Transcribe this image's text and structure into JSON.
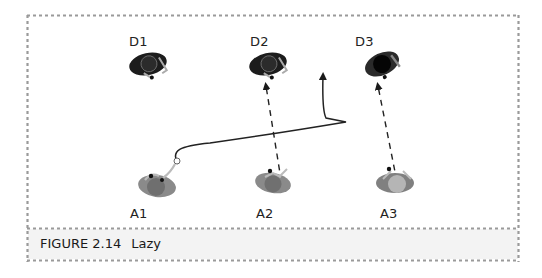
{
  "figure": {
    "caption_label": "FIGURE 2.14",
    "caption_title": "Lazy",
    "colors": {
      "border_dots": "#9a9a9a",
      "caption_fill": "#f3f3f3",
      "defender_body": "#1c1c1c",
      "attacker_body": "#8a8a8a",
      "attacker_head_a1": "#6f6f6f",
      "attacker_head_a2": "#707070",
      "attacker_head_a3": "#b5b5b5",
      "path_line": "#222222"
    }
  },
  "players": {
    "defenders": [
      {
        "id": "D1",
        "label": "D1"
      },
      {
        "id": "D2",
        "label": "D2"
      },
      {
        "id": "D3",
        "label": "D3"
      }
    ],
    "attackers": [
      {
        "id": "A1",
        "label": "A1"
      },
      {
        "id": "A2",
        "label": "A2"
      },
      {
        "id": "A3",
        "label": "A3"
      }
    ]
  },
  "movements": [
    {
      "from": "A1",
      "type": "solid-curve",
      "description": "A1 runs right across the field, then cuts up"
    },
    {
      "from": "A2",
      "to": "D2",
      "type": "dashed-arrow"
    },
    {
      "from": "A3",
      "to": "D3",
      "type": "dashed-arrow"
    }
  ]
}
